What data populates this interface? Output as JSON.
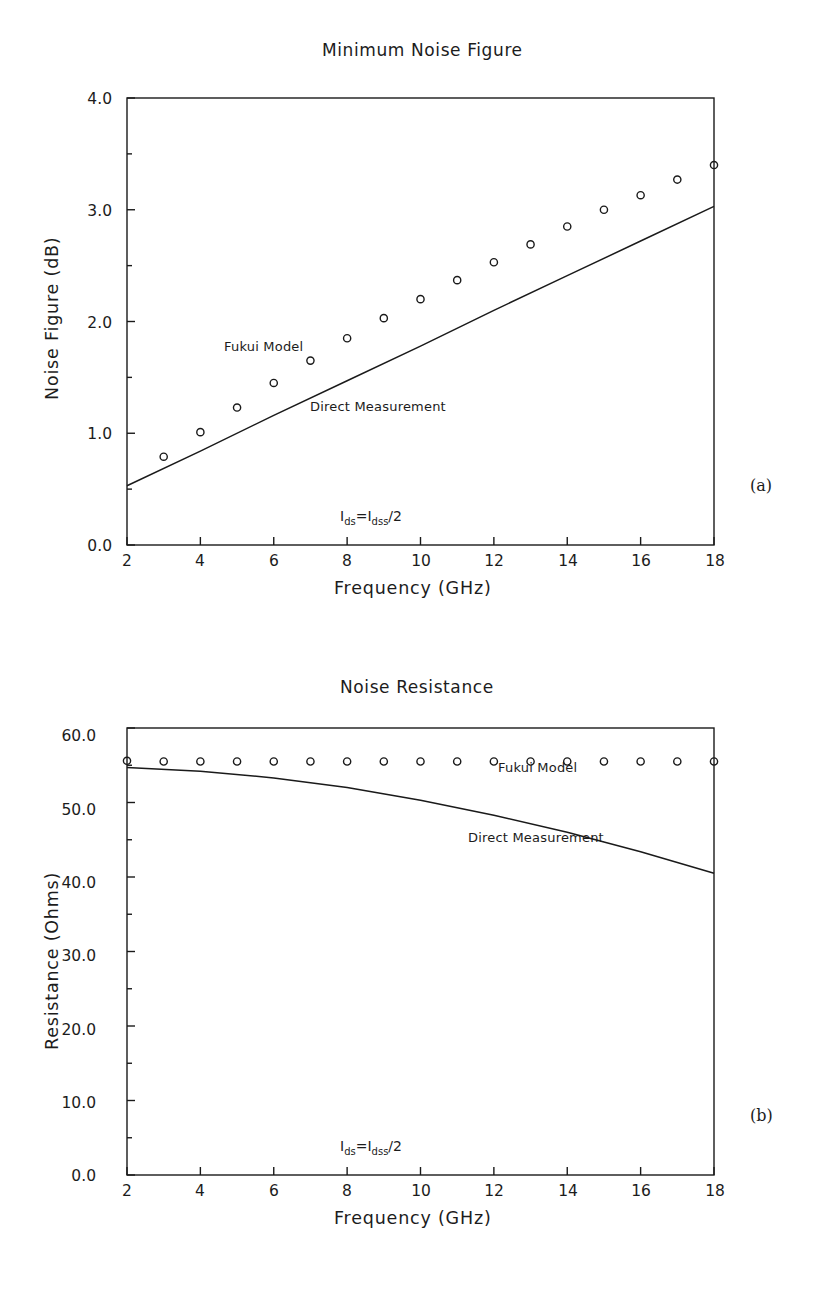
{
  "panels": [
    {
      "id": "a",
      "panel_label": "(a)",
      "title": "Minimum Noise Figure",
      "xlabel": "Frequency (GHz)",
      "ylabel": "Noise Figure (dB)",
      "annotation": {
        "sym1": "I",
        "sub1": "ds",
        "eq": "=",
        "sym2": "I",
        "sub2": "dss",
        "tail": "/2"
      },
      "series_labels": {
        "markers": "Fukui Model",
        "line": "Direct Measurement"
      },
      "yticks": [
        "0.0",
        "1.0",
        "2.0",
        "3.0",
        "4.0"
      ],
      "xticks": [
        "2",
        "4",
        "6",
        "8",
        "10",
        "12",
        "14",
        "16",
        "18"
      ]
    },
    {
      "id": "b",
      "panel_label": "(b)",
      "title": "Noise Resistance",
      "xlabel": "Frequency (GHz)",
      "ylabel": "Resistance (Ohms)",
      "annotation": {
        "sym1": "I",
        "sub1": "ds",
        "eq": "=",
        "sym2": "I",
        "sub2": "dss",
        "tail": "/2"
      },
      "series_labels": {
        "markers": "Fukui Model",
        "line": "Direct Measurement"
      },
      "yticks": [
        "0.0",
        "10.0",
        "20.0",
        "30.0",
        "40.0",
        "50.0",
        "60.0"
      ],
      "xticks": [
        "2",
        "4",
        "6",
        "8",
        "10",
        "12",
        "14",
        "16",
        "18"
      ]
    }
  ],
  "chart_data": [
    {
      "type": "scatter",
      "panel": "(a)",
      "title": "Minimum Noise Figure",
      "xlabel": "Frequency (GHz)",
      "ylabel": "Noise Figure (dB)",
      "xlim": [
        2,
        18
      ],
      "ylim": [
        0.0,
        4.0
      ],
      "xticks": [
        2,
        4,
        6,
        8,
        10,
        12,
        14,
        16,
        18
      ],
      "yticks": [
        0.0,
        1.0,
        2.0,
        3.0,
        4.0
      ],
      "grid": false,
      "legend": "inline-annotations",
      "annotations": [
        "Ids=Idss/2"
      ],
      "series": [
        {
          "name": "Fukui Model",
          "type": "scatter",
          "marker": "open-circle",
          "x": [
            3,
            4,
            5,
            6,
            7,
            8,
            9,
            10,
            11,
            12,
            13,
            14,
            15,
            16,
            17,
            18
          ],
          "values": [
            0.79,
            1.01,
            1.23,
            1.45,
            1.65,
            1.85,
            2.03,
            2.2,
            2.37,
            2.53,
            2.69,
            2.85,
            3.0,
            3.13,
            3.27,
            3.4
          ]
        },
        {
          "name": "Direct Measurement",
          "type": "line",
          "x": [
            2,
            4,
            6,
            8,
            10,
            12,
            14,
            16,
            18
          ],
          "values": [
            0.53,
            0.84,
            1.16,
            1.47,
            1.78,
            2.1,
            2.41,
            2.72,
            3.03
          ]
        }
      ]
    },
    {
      "type": "scatter",
      "panel": "(b)",
      "title": "Noise Resistance",
      "xlabel": "Frequency (GHz)",
      "ylabel": "Resistance (Ohms)",
      "xlim": [
        2,
        18
      ],
      "ylim": [
        0.0,
        60.0
      ],
      "xticks": [
        2,
        4,
        6,
        8,
        10,
        12,
        14,
        16,
        18
      ],
      "yticks": [
        0.0,
        10.0,
        20.0,
        30.0,
        40.0,
        50.0,
        60.0
      ],
      "grid": false,
      "legend": "inline-annotations",
      "annotations": [
        "Ids=Idss/2"
      ],
      "series": [
        {
          "name": "Fukui Model",
          "type": "scatter",
          "marker": "open-circle",
          "x": [
            2,
            3,
            4,
            5,
            6,
            7,
            8,
            9,
            10,
            11,
            12,
            13,
            14,
            15,
            16,
            17,
            18
          ],
          "values": [
            55.6,
            55.5,
            55.5,
            55.5,
            55.5,
            55.5,
            55.5,
            55.5,
            55.5,
            55.5,
            55.5,
            55.5,
            55.5,
            55.5,
            55.5,
            55.5,
            55.5
          ]
        },
        {
          "name": "Direct Measurement",
          "type": "line",
          "x": [
            2,
            4,
            6,
            8,
            10,
            12,
            14,
            16,
            18
          ],
          "values": [
            54.7,
            54.2,
            53.3,
            52.0,
            50.3,
            48.3,
            46.0,
            43.4,
            40.5
          ]
        }
      ]
    }
  ],
  "style": {
    "axis_color": "#1a1a1a",
    "marker_color": "#1a1a1a",
    "line_color": "#1a1a1a",
    "background": "#ffffff"
  }
}
